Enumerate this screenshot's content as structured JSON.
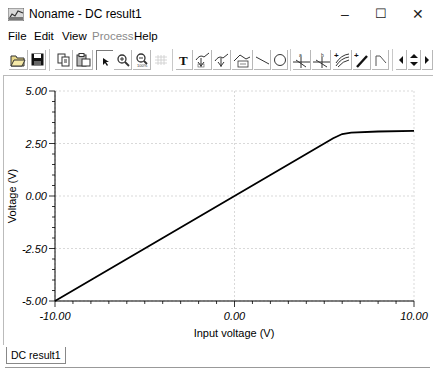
{
  "window": {
    "title": "Noname - DC result1",
    "controls": {
      "minimize": "–",
      "maximize": "☐",
      "close": "✕"
    }
  },
  "menu": {
    "items": [
      {
        "label": "File",
        "enabled": true
      },
      {
        "label": "Edit",
        "enabled": true
      },
      {
        "label": "View",
        "enabled": true
      },
      {
        "label": "Process",
        "enabled": false
      },
      {
        "label": "Help",
        "enabled": true
      }
    ]
  },
  "toolbar": {
    "buttons": [
      "open-icon",
      "save-icon",
      "copy-icon",
      "paste-icon",
      "pointer-icon",
      "zoom-in-icon",
      "zoom-out-icon",
      "grid-icon",
      "text-icon",
      "cursor-a-icon",
      "cursor-b-icon",
      "label-icon",
      "line-icon",
      "circle-icon",
      "marker-a-icon",
      "marker-b-icon",
      "add-curve-icon",
      "probe-icon",
      "step-icon",
      "scroll-left-icon",
      "scroll-updown-icon",
      "scroll-right-icon"
    ]
  },
  "tabs": [
    {
      "label": "DC result1",
      "active": true
    }
  ],
  "chart_data": {
    "type": "line",
    "title": "",
    "xlabel": "Input voltage (V)",
    "ylabel": "Voltage (V)",
    "xlim": [
      -10,
      10
    ],
    "ylim": [
      -5,
      5
    ],
    "x_ticks": [
      "-10.00",
      "0.00",
      "10.00"
    ],
    "y_ticks": [
      "5.00",
      "2.50",
      "0.00",
      "-2.50",
      "-5.00"
    ],
    "grid": true,
    "legend": null,
    "series": [
      {
        "name": "DC result1",
        "color": "#000000",
        "x": [
          -10.0,
          -8.0,
          -6.0,
          -4.0,
          -2.0,
          0.0,
          2.0,
          4.0,
          5.5,
          6.0,
          6.5,
          8.0,
          10.0
        ],
        "y": [
          -5.0,
          -4.0,
          -3.0,
          -2.0,
          -1.0,
          0.0,
          1.0,
          2.0,
          2.75,
          2.95,
          3.02,
          3.07,
          3.1
        ]
      }
    ]
  }
}
